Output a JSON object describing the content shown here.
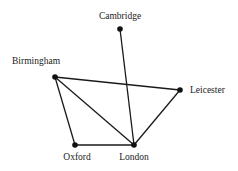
{
  "diagram": {
    "type": "undirected-graph",
    "nodes": [
      {
        "id": "cambridge",
        "label": "Cambridge",
        "x": 120,
        "y": 29,
        "lx": 120,
        "ly": 19,
        "anchor": "middle"
      },
      {
        "id": "birmingham",
        "label": "Birmingham",
        "x": 55,
        "y": 77,
        "lx": 12,
        "ly": 64,
        "anchor": "start"
      },
      {
        "id": "leicester",
        "label": "Leicester",
        "x": 180,
        "y": 90,
        "lx": 190,
        "ly": 93,
        "anchor": "start"
      },
      {
        "id": "oxford",
        "label": "Oxford",
        "x": 75,
        "y": 145,
        "lx": 77,
        "ly": 160,
        "anchor": "middle"
      },
      {
        "id": "london",
        "label": "London",
        "x": 134,
        "y": 145,
        "lx": 134,
        "ly": 160,
        "anchor": "middle"
      }
    ],
    "edges": [
      [
        "cambridge",
        "london"
      ],
      [
        "birmingham",
        "leicester"
      ],
      [
        "birmingham",
        "oxford"
      ],
      [
        "birmingham",
        "london"
      ],
      [
        "oxford",
        "london"
      ],
      [
        "london",
        "leicester"
      ]
    ]
  }
}
